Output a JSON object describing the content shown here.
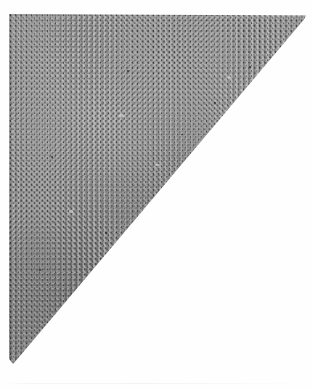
{
  "image": {
    "subject": "fabric-swatch",
    "description": "Gray woven fabric swatch cut on a diagonal, photographed on a white background",
    "background_color": "#ffffff",
    "width": 312,
    "height": 389
  },
  "fabric": {
    "name": "woven-twill-swatch",
    "material": "textile",
    "weave": "twill",
    "base_color": "#8d8d8d",
    "highlight_color": "#d6d6d6",
    "shadow_color": "#3c3c3c",
    "fleck_color": "#121212",
    "shape": "right-triangle",
    "weave_pitch_px": 5.3
  },
  "geometry": {
    "top_left": "10,15",
    "top_right_apex": "305,16",
    "bottom_left_tip": "13,363",
    "hypotenuse_angle_deg": -49.7
  },
  "specks": [
    {
      "name": "slub-1",
      "left": 70,
      "top": 300,
      "w": 4,
      "h": 3
    },
    {
      "name": "slub-2",
      "left": 74,
      "top": 304,
      "w": 3,
      "h": 2
    },
    {
      "name": "slub-3",
      "left": 118,
      "top": 56,
      "w": 2,
      "h": 2
    },
    {
      "name": "slub-4",
      "left": 155,
      "top": 185,
      "w": 2,
      "h": 2
    },
    {
      "name": "slub-5",
      "left": 205,
      "top": 88,
      "w": 2,
      "h": 2
    },
    {
      "name": "slub-6",
      "left": 42,
      "top": 142,
      "w": 2,
      "h": 2
    },
    {
      "name": "slub-7",
      "left": 96,
      "top": 218,
      "w": 2,
      "h": 2
    },
    {
      "name": "slub-8",
      "left": 172,
      "top": 120,
      "w": 2,
      "h": 1
    },
    {
      "name": "slub-9",
      "left": 30,
      "top": 255,
      "w": 2,
      "h": 2
    },
    {
      "name": "slub-10",
      "left": 240,
      "top": 52,
      "w": 2,
      "h": 2
    }
  ],
  "lint": [
    {
      "name": "lint-1",
      "left": 110,
      "top": 100,
      "w": 5,
      "h": 3
    },
    {
      "name": "lint-2",
      "left": 218,
      "top": 62,
      "w": 4,
      "h": 3
    },
    {
      "name": "lint-3",
      "left": 60,
      "top": 196,
      "w": 4,
      "h": 3
    },
    {
      "name": "lint-4",
      "left": 146,
      "top": 150,
      "w": 5,
      "h": 2
    }
  ]
}
